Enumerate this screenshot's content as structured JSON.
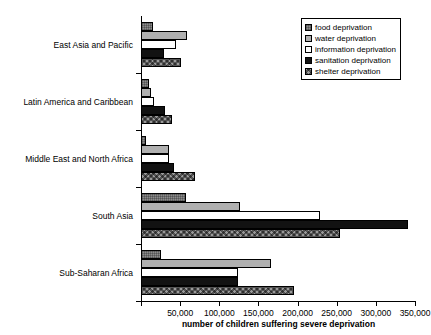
{
  "chart_data": {
    "type": "bar",
    "orientation": "horizontal",
    "title": "",
    "xlabel": "number of children suffering severe deprivation",
    "ylabel": "",
    "xlim": [
      0,
      350000
    ],
    "xticks": [
      0,
      50000,
      100000,
      150000,
      200000,
      250000,
      300000,
      350000
    ],
    "xticklabels": [
      "",
      "50,000",
      "100,000",
      "150,000",
      "200,000",
      "250,000",
      "300,000",
      "350,000"
    ],
    "grid": false,
    "legend_position": "top-right",
    "categories": [
      "East Asia and Pacific",
      "Latin America and Caribbean",
      "Middle East and North Africa",
      "South Asia",
      "Sub-Saharan Africa"
    ],
    "series": [
      {
        "name": "food deprivation",
        "swatch": "dotted-gray",
        "color": "#8c8c8c",
        "values": [
          15000,
          10000,
          6000,
          58000,
          26000
        ]
      },
      {
        "name": "water deprivation",
        "swatch": "light-gray",
        "color": "#b0b0b0",
        "values": [
          59000,
          13000,
          36000,
          126000,
          166000
        ]
      },
      {
        "name": "information deprivation",
        "swatch": "white",
        "color": "#ffffff",
        "values": [
          45000,
          17000,
          36000,
          229000,
          124000
        ]
      },
      {
        "name": "sanitation deprivation",
        "swatch": "solid-black",
        "color": "#121212",
        "values": [
          30000,
          31000,
          42000,
          341000,
          124000
        ]
      },
      {
        "name": "shelter deprivation",
        "swatch": "crosshatch-gray",
        "color": "#9a9a9a",
        "values": [
          51000,
          40000,
          69000,
          254000,
          196000
        ]
      }
    ]
  }
}
